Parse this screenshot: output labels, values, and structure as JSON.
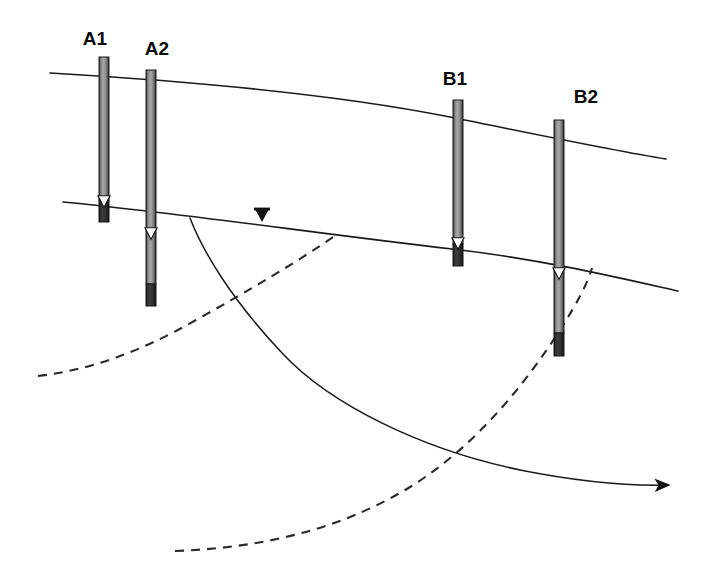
{
  "figure": {
    "kind": "hydrogeologic-cross-section",
    "background_color": "#ffffff",
    "line_color": "#1a1a1a",
    "casing_fill_color": "#6e6e6e",
    "screen_fill_color": "#2b2b2b",
    "width": 708,
    "height": 580
  },
  "wells": [
    {
      "id": "A1",
      "label": "A1",
      "label_x": 95,
      "label_y": 45,
      "x": 99,
      "width": 10,
      "top_y": 57,
      "bottom_y": 222,
      "screen_top_y": 200,
      "water_level_y": 202,
      "marker": "open-triangle"
    },
    {
      "id": "A2",
      "label": "A2",
      "label_x": 157,
      "label_y": 55,
      "x": 146,
      "width": 10,
      "top_y": 70,
      "bottom_y": 306,
      "screen_top_y": 284,
      "water_level_y": 234,
      "marker": "open-triangle"
    },
    {
      "id": "B1",
      "label": "B1",
      "label_x": 455,
      "label_y": 85,
      "x": 453,
      "width": 10,
      "top_y": 100,
      "bottom_y": 266,
      "screen_top_y": 244,
      "water_level_y": 244,
      "marker": "open-triangle"
    },
    {
      "id": "B2",
      "label": "B2",
      "label_x": 586,
      "label_y": 103,
      "x": 554,
      "width": 10,
      "top_y": 120,
      "bottom_y": 356,
      "screen_top_y": 333,
      "water_level_y": 274,
      "marker": "open-triangle"
    }
  ],
  "surfaces": [
    {
      "id": "ground-surface",
      "name": "ground-surface-line",
      "style": "solid",
      "path": "M 50 73 C 170 80, 330 93, 450 117 C 530 133, 610 150, 666 159"
    },
    {
      "id": "water-table",
      "name": "water-table-line",
      "style": "solid",
      "path": "M 63 202 C 180 213, 320 234, 452 249 C 540 259, 620 278, 678 291"
    }
  ],
  "water_table_symbol": {
    "name": "water-table-triangle",
    "x": 262,
    "y": 218,
    "size": 13,
    "fill": "#111111"
  },
  "flow_paths": [
    {
      "id": "flowline-solid",
      "name": "groundwater-flow-path",
      "style": "solid",
      "arrow": true,
      "path": "M 190 218 C 203 252, 232 300, 283 354 C 330 404, 420 449, 520 470 C 580 482, 630 486, 668 485"
    },
    {
      "id": "flowline-dashed-upper",
      "name": "dashed-flow-boundary-upper",
      "style": "dashed",
      "arrow": false,
      "path": "M 38 376 C 90 370, 140 352, 196 320 C 250 290, 300 260, 333 237"
    },
    {
      "id": "flowline-dashed-lower",
      "name": "dashed-flow-boundary-lower",
      "style": "dashed",
      "arrow": false,
      "path": "M 175 551 C 260 548, 340 530, 410 487 C 470 450, 520 392, 560 330 C 578 302, 588 282, 592 268"
    }
  ]
}
